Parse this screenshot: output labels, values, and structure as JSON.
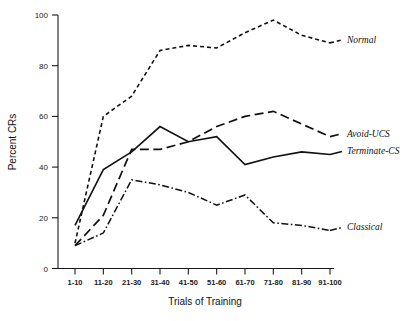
{
  "chart_data": {
    "type": "line",
    "title": "",
    "xlabel": "Trials of Training",
    "ylabel": "Percent CRs",
    "categories": [
      "1-10",
      "11-20",
      "21-30",
      "31-40",
      "41-50",
      "51-60",
      "61-70",
      "71-80",
      "81-90",
      "91-100"
    ],
    "ylim": [
      0,
      100
    ],
    "yticks": [
      0,
      20,
      40,
      60,
      80,
      100
    ],
    "grid": false,
    "legend_position": "right-inline",
    "series": [
      {
        "name": "Normal",
        "style": "short-dashed",
        "values": [
          10,
          60,
          68,
          86,
          88,
          87,
          93,
          98,
          92,
          89
        ]
      },
      {
        "name": "Avoid-UCS",
        "style": "long-dashed",
        "values": [
          9,
          21,
          47,
          47,
          50,
          56,
          60,
          62,
          57,
          52
        ]
      },
      {
        "name": "Terminate-CS",
        "style": "solid",
        "values": [
          17,
          39,
          46,
          56,
          50,
          52,
          41,
          44,
          46,
          45
        ]
      },
      {
        "name": "Classical",
        "style": "dash-dot",
        "values": [
          9,
          14,
          35,
          33,
          30,
          25,
          29,
          18,
          17,
          15
        ]
      }
    ]
  },
  "labels": {
    "y_axis_title": "Percent CRs",
    "x_axis_title": "Trials of Training",
    "series_normal": "Normal",
    "series_avoid": "Avoid-UCS",
    "series_terminate": "Terminate-CS",
    "series_classical": "Classical",
    "ytick_0": "0",
    "ytick_20": "20",
    "ytick_40": "40",
    "ytick_60": "60",
    "ytick_80": "80",
    "ytick_100": "100",
    "xtick_0": "1-10",
    "xtick_1": "11-20",
    "xtick_2": "21-30",
    "xtick_3": "31-40",
    "xtick_4": "41-50",
    "xtick_5": "51-60",
    "xtick_6": "61-70",
    "xtick_7": "71-80",
    "xtick_8": "81-90",
    "xtick_9": "91-100"
  },
  "colors": {
    "ink": "#111111",
    "background": "#ffffff"
  }
}
